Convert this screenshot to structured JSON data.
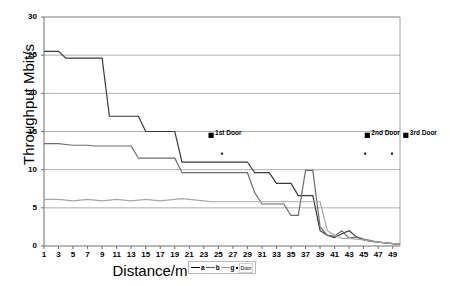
{
  "chart_data": {
    "type": "line",
    "title": "",
    "xlabel": "Distance/m",
    "ylabel": "Throughput Mbit/s",
    "xlim": [
      1,
      50
    ],
    "ylim": [
      0,
      30
    ],
    "ytick_labels": [
      "0",
      "5",
      "10",
      "15",
      "20",
      "25",
      "30"
    ],
    "ytick_values": [
      0,
      5,
      10,
      15,
      20,
      25,
      30
    ],
    "xtick_labels": [
      "1",
      "3",
      "5",
      "7",
      "9",
      "11",
      "13",
      "15",
      "17",
      "19",
      "21",
      "23",
      "25",
      "27",
      "29",
      "31",
      "33",
      "35",
      "37",
      "39",
      "41",
      "43",
      "45",
      "47",
      "49"
    ],
    "xtick_values": [
      1,
      3,
      5,
      7,
      9,
      11,
      13,
      15,
      17,
      19,
      21,
      23,
      25,
      27,
      29,
      31,
      33,
      35,
      37,
      39,
      41,
      43,
      45,
      47,
      49
    ],
    "grid": "horizontal",
    "legend_position": "bottom-right",
    "x": [
      1,
      2,
      3,
      4,
      5,
      6,
      7,
      8,
      9,
      10,
      11,
      12,
      13,
      14,
      15,
      16,
      17,
      18,
      19,
      20,
      21,
      22,
      23,
      24,
      25,
      26,
      27,
      28,
      29,
      30,
      31,
      32,
      33,
      34,
      35,
      36,
      37,
      38,
      39,
      40,
      41,
      42,
      43,
      44,
      45,
      46,
      47,
      48,
      49,
      50
    ],
    "series": [
      {
        "name": "a",
        "color": "#3a3a3a",
        "values": [
          25.5,
          25.5,
          25.5,
          24.6,
          24.6,
          24.6,
          24.6,
          24.6,
          24.6,
          17.0,
          17.0,
          17.0,
          17.0,
          17.0,
          15.0,
          15.0,
          15.0,
          15.0,
          15.0,
          11.0,
          11.0,
          11.0,
          11.0,
          11.0,
          11.0,
          11.0,
          11.0,
          11.0,
          11.0,
          9.6,
          9.6,
          9.6,
          8.2,
          8.2,
          8.2,
          6.6,
          6.6,
          6.6,
          2.0,
          1.4,
          1.1,
          1.6,
          2.0,
          1.2,
          0.8,
          0.6,
          0.5,
          0.4,
          0.3,
          0.2
        ]
      },
      {
        "name": "b",
        "color": "#6b6b6b",
        "values": [
          13.4,
          13.4,
          13.4,
          13.3,
          13.2,
          13.2,
          13.2,
          13.1,
          13.1,
          13.1,
          13.1,
          13.1,
          13.1,
          11.5,
          11.5,
          11.5,
          11.5,
          11.5,
          11.5,
          9.6,
          9.6,
          9.6,
          9.6,
          9.6,
          9.6,
          9.6,
          9.6,
          9.6,
          9.6,
          7.0,
          5.5,
          5.5,
          5.5,
          5.5,
          4.0,
          4.0,
          9.9,
          9.9,
          2.5,
          1.4,
          1.3,
          2.0,
          1.0,
          1.2,
          0.9,
          0.7,
          0.5,
          0.4,
          0.3,
          0.2
        ]
      },
      {
        "name": "g",
        "color": "#a6a6a6",
        "values": [
          6.1,
          6.1,
          6.1,
          6.0,
          5.9,
          6.0,
          6.1,
          6.0,
          5.9,
          6.0,
          6.1,
          6.0,
          5.9,
          6.0,
          6.1,
          6.0,
          5.9,
          6.0,
          6.1,
          6.2,
          6.1,
          6.0,
          5.9,
          5.8,
          5.8,
          5.8,
          5.8,
          5.8,
          5.8,
          5.8,
          5.8,
          5.8,
          5.8,
          5.8,
          5.8,
          5.8,
          5.8,
          5.8,
          5.8,
          2.0,
          1.4,
          1.0,
          1.0,
          0.9,
          0.8,
          0.6,
          0.5,
          0.4,
          0.3,
          0.2
        ]
      }
    ],
    "door_markers": [
      {
        "label": "1st Door",
        "x": 24,
        "y": 14.5
      },
      {
        "label": "2nd Door",
        "x": 45.5,
        "y": 14.5
      },
      {
        "label": "3rd Door",
        "x": 50.8,
        "y": 14.5
      }
    ],
    "door_points": [
      {
        "x": 25.5,
        "y": 12.1
      },
      {
        "x": 45.2,
        "y": 12.1
      },
      {
        "x": 48.9,
        "y": 12.1
      }
    ],
    "legend": [
      {
        "label": "a",
        "type": "line",
        "color": "#3a3a3a"
      },
      {
        "label": "b",
        "type": "line",
        "color": "#6b6b6b"
      },
      {
        "label": "g",
        "type": "line",
        "color": "#a6a6a6"
      },
      {
        "label": "Door",
        "type": "marker",
        "color": "#000000"
      }
    ]
  }
}
